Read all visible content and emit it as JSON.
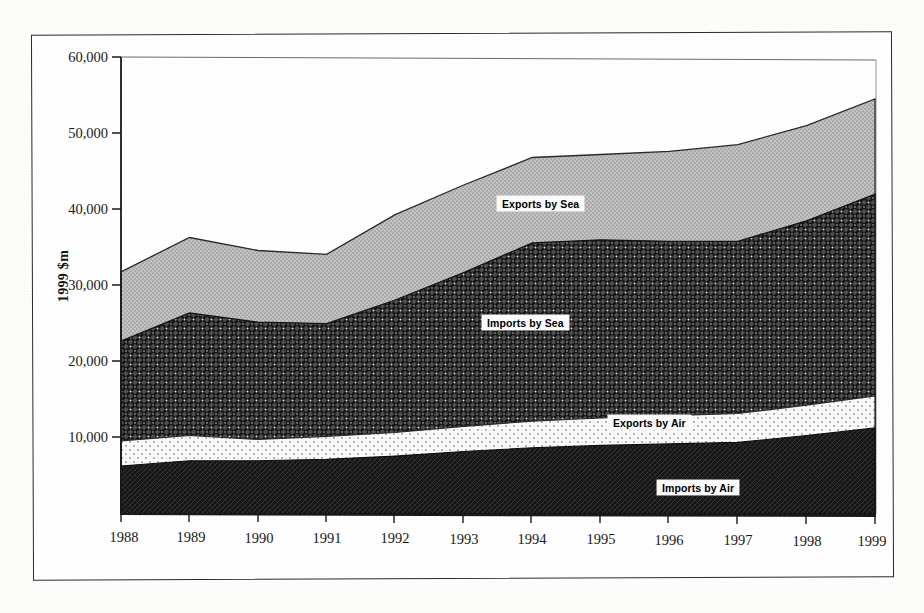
{
  "figure": {
    "y_axis_title": "1999 $m",
    "border": "#2b2b2b"
  },
  "labels": {
    "exports_by_sea": "Exports by Sea",
    "imports_by_sea": "Imports by Sea",
    "exports_by_air": "Exports by Air",
    "imports_by_air": "Imports by Air"
  },
  "y_ticks": {
    "t0": "10,000",
    "t1": "20,000",
    "t2": "30,000",
    "t3": "40,000",
    "t4": "50,000",
    "t5": "60,000"
  },
  "x_ticks": {
    "y1988": "1988",
    "y1989": "1989",
    "y1990": "1990",
    "y1991": "1991",
    "y1992": "1992",
    "y1993": "1993",
    "y1994": "1994",
    "y1995": "1995",
    "y1996": "1996",
    "y1997": "1997",
    "y1998": "1998",
    "y1999": "1999"
  },
  "colors": {
    "exports_by_sea": "#b0b0b0",
    "imports_by_sea": "#4a4a4a",
    "exports_by_air": "#ffffff",
    "imports_by_air": "#1a1a1a",
    "axis": "#1a1a1a",
    "frame": "#2b2b2b",
    "background": "#ffffff"
  },
  "chart_data": {
    "type": "area",
    "stacked": true,
    "title": "",
    "subtitle": "",
    "xlabel": "",
    "ylabel": "1999 $m",
    "ylim": [
      0,
      60000
    ],
    "yticks": [
      0,
      10000,
      20000,
      30000,
      40000,
      50000,
      60000
    ],
    "grid": false,
    "legend": "in-plot labels",
    "categories": [
      "1988",
      "1989",
      "1990",
      "1991",
      "1992",
      "1993",
      "1994",
      "1995",
      "1996",
      "1997",
      "1998",
      "1999"
    ],
    "series": [
      {
        "name": "Imports by Air",
        "values": [
          6300,
          7000,
          7000,
          7200,
          7600,
          8200,
          8700,
          9000,
          9200,
          9400,
          10300,
          11300
        ]
      },
      {
        "name": "Exports by Air",
        "values": [
          3300,
          3300,
          2800,
          3000,
          3100,
          3300,
          3500,
          3600,
          3700,
          3800,
          4000,
          4200
        ]
      },
      {
        "name": "Imports by Sea",
        "values": [
          13100,
          16100,
          15400,
          14800,
          17400,
          20200,
          23400,
          23400,
          22900,
          22600,
          24200,
          26500
        ]
      },
      {
        "name": "Exports by Sea",
        "values": [
          9100,
          9900,
          9400,
          9100,
          11200,
          11500,
          11200,
          11200,
          11800,
          12700,
          12500,
          12500
        ]
      }
    ],
    "cumulative_totals": [
      31800,
      36300,
      34600,
      34100,
      39300,
      43200,
      46800,
      47200,
      47600,
      48500,
      51000,
      54500
    ],
    "stack_order_bottom_to_top": [
      "Imports by Air",
      "Exports by Air",
      "Imports by Sea",
      "Exports by Sea"
    ]
  }
}
